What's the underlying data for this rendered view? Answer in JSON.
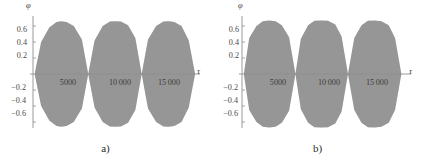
{
  "figure": {
    "background": "#ffffff",
    "fill_color": "#9a9a9a",
    "axis_color": "#8f8f8f",
    "text_color": "#3d3d3d"
  },
  "chart_data": [
    {
      "type": "area",
      "panel": "a",
      "caption": "a)",
      "title": "",
      "xlabel": "τ",
      "ylabel": "φ",
      "xlim": [
        0,
        18000
      ],
      "ylim": [
        -0.72,
        0.72
      ],
      "xticks": [
        5000,
        10000,
        15000
      ],
      "xtick_labels": [
        "5000",
        "10 000",
        "15 000"
      ],
      "yticks": [
        0.6,
        0.4,
        0.2,
        -0.2,
        -0.4,
        -0.6
      ],
      "ytick_labels": [
        "0.6",
        "0.4",
        "0.2",
        "−0.2",
        "−0.4",
        "−0.6"
      ],
      "grid": false,
      "legend": false,
      "description": "Dense oscillation of φ filling a beating envelope; three lobes with nodes where amplitude collapses to zero.",
      "envelope_amplitude": 0.66,
      "envelope_nodes": [
        180,
        6100,
        12000,
        17900
      ],
      "envelope_peaks": [
        3100,
        9050,
        15000
      ],
      "lobe_shape": "pointed",
      "series": [
        {
          "name": "φ(τ) envelope",
          "x": [
            180,
            900,
            1800,
            2600,
            3100,
            3700,
            4500,
            5400,
            6100,
            6800,
            7700,
            8500,
            9050,
            9700,
            10500,
            11300,
            12000,
            12700,
            13600,
            14400,
            15000,
            15600,
            16400,
            17200,
            17900
          ],
          "upper": [
            0.0,
            0.4,
            0.58,
            0.65,
            0.66,
            0.65,
            0.6,
            0.43,
            0.0,
            0.42,
            0.6,
            0.655,
            0.66,
            0.655,
            0.61,
            0.45,
            0.0,
            0.43,
            0.6,
            0.655,
            0.66,
            0.65,
            0.6,
            0.42,
            0.0
          ],
          "lower": [
            0.0,
            -0.4,
            -0.58,
            -0.65,
            -0.66,
            -0.65,
            -0.6,
            -0.43,
            0.0,
            -0.42,
            -0.6,
            -0.655,
            -0.66,
            -0.655,
            -0.61,
            -0.45,
            0.0,
            -0.43,
            -0.6,
            -0.655,
            -0.66,
            -0.65,
            -0.6,
            -0.42,
            0.0
          ]
        }
      ]
    },
    {
      "type": "area",
      "panel": "b",
      "caption": "b)",
      "title": "",
      "xlabel": "τ",
      "ylabel": "φ",
      "xlim": [
        0,
        18000
      ],
      "ylim": [
        -0.72,
        0.72
      ],
      "xticks": [
        5000,
        10000,
        15000
      ],
      "xtick_labels": [
        "5000",
        "10 000",
        "15 000"
      ],
      "yticks": [
        0.6,
        0.4,
        0.2,
        -0.2,
        -0.4,
        -0.6
      ],
      "ytick_labels": [
        "0.6",
        "0.4",
        "0.2",
        "−0.2",
        "−0.4",
        "−0.6"
      ],
      "grid": false,
      "legend": false,
      "description": "Dense oscillation of φ filling a beating envelope; three broad elliptical lobes with narrow nodes.",
      "envelope_amplitude": 0.67,
      "envelope_nodes": [
        200,
        5900,
        11700,
        17600
      ],
      "envelope_peaks": [
        3000,
        8800,
        14650
      ],
      "lobe_shape": "elliptical",
      "series": [
        {
          "name": "φ(τ) envelope",
          "x": [
            200,
            800,
            1600,
            2300,
            3000,
            3700,
            4400,
            5200,
            5900,
            6500,
            7300,
            8000,
            8800,
            9500,
            10300,
            11000,
            11700,
            12400,
            13200,
            13900,
            14650,
            15400,
            16200,
            16900,
            17600
          ],
          "upper": [
            0.0,
            0.45,
            0.6,
            0.66,
            0.67,
            0.66,
            0.61,
            0.46,
            0.0,
            0.44,
            0.61,
            0.665,
            0.67,
            0.665,
            0.62,
            0.47,
            0.0,
            0.45,
            0.61,
            0.665,
            0.67,
            0.66,
            0.61,
            0.45,
            0.0
          ],
          "lower": [
            0.0,
            -0.45,
            -0.6,
            -0.66,
            -0.67,
            -0.66,
            -0.61,
            -0.46,
            0.0,
            -0.44,
            -0.61,
            -0.665,
            -0.67,
            -0.665,
            -0.62,
            -0.47,
            0.0,
            -0.45,
            -0.61,
            -0.665,
            -0.67,
            -0.66,
            -0.61,
            -0.45,
            0.0
          ]
        }
      ]
    }
  ]
}
